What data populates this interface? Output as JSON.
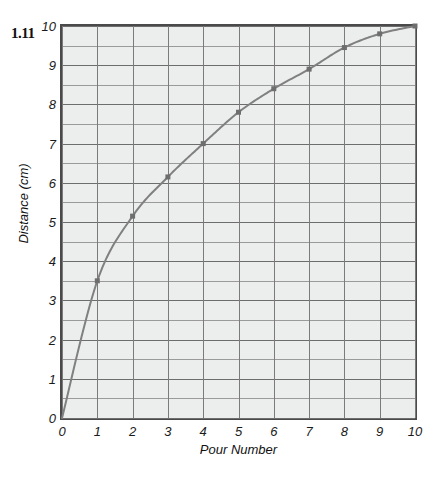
{
  "problem": {
    "number": "1.11"
  },
  "chart_data": {
    "type": "line",
    "title": "",
    "xlabel": "Pour Number",
    "ylabel": "Distance (cm)",
    "xlim": [
      0,
      10
    ],
    "ylim": [
      0,
      10
    ],
    "x": [
      0,
      1,
      2,
      3,
      4,
      5,
      6,
      7,
      8,
      9,
      10
    ],
    "values": [
      0,
      3.5,
      5.15,
      6.15,
      7.0,
      7.8,
      8.4,
      8.9,
      9.45,
      9.8,
      10.0
    ],
    "series": [
      {
        "name": "Distance vs Pour Number",
        "values": [
          0,
          3.5,
          5.15,
          6.15,
          7.0,
          7.8,
          8.4,
          8.9,
          9.45,
          9.8,
          10.0
        ]
      }
    ],
    "xticks": [
      "0",
      "1",
      "2",
      "3",
      "4",
      "5",
      "6",
      "7",
      "8",
      "9",
      "10"
    ],
    "yticks": [
      "0",
      "1",
      "2",
      "3",
      "4",
      "5",
      "6",
      "7",
      "8",
      "9",
      "10"
    ],
    "grid": true,
    "grid_minor_y": true,
    "legend": "none",
    "marker": "square",
    "line_color": "#808080",
    "marker_color": "#6e6e6e",
    "plot_background": "#eceded",
    "grid_color": "#7b7b7b",
    "axis_color": "#4a4a4a"
  }
}
